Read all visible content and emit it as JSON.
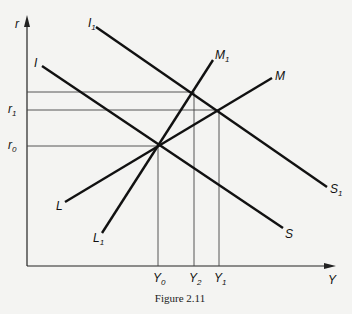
{
  "figure": {
    "caption": "Figure 2.11",
    "axes": {
      "x_label": "Y",
      "y_label": "r"
    },
    "curves": [
      {
        "id": "IS",
        "start_label": "I",
        "end_label": "S"
      },
      {
        "id": "I1S1",
        "start_label": "I",
        "start_sub": "1",
        "end_label": "S",
        "end_sub": "1"
      },
      {
        "id": "LM",
        "start_label": "L",
        "end_label": "M"
      },
      {
        "id": "L1M1",
        "start_label": "L",
        "start_sub": "1",
        "end_label": "M",
        "end_sub": "1"
      }
    ],
    "y_ticks": [
      {
        "label": "r",
        "sub": "1"
      },
      {
        "label": "r",
        "sub": "0"
      }
    ],
    "x_ticks": [
      {
        "label": "Y",
        "sub": "0"
      },
      {
        "label": "Y",
        "sub": "2"
      },
      {
        "label": "Y",
        "sub": "1"
      }
    ]
  }
}
